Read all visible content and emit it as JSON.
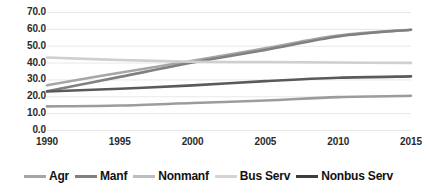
{
  "chart_data": {
    "type": "line",
    "title": "",
    "subtitle": "",
    "xlabel": "",
    "ylabel": "",
    "x": [
      1990,
      1995,
      2000,
      2005,
      2010,
      2015
    ],
    "categories": [
      "1990",
      "1995",
      "2000",
      "2005",
      "2010",
      "2015"
    ],
    "xtick_labels": [
      "1990",
      "1995",
      "2000",
      "2005",
      "2010",
      "2015"
    ],
    "ytick_labels": [
      "70.0",
      "60.0",
      "50.0",
      "40.0",
      "30.0",
      "20.0",
      "10.0",
      "0.0"
    ],
    "ytick_values": [
      70.0,
      60.0,
      50.0,
      40.0,
      30.0,
      20.0,
      10.0,
      0.0
    ],
    "ylim": [
      0.0,
      70.0
    ],
    "xlim": [
      1990,
      2015
    ],
    "grid": true,
    "grid_axis": "y",
    "legend_position": "bottom",
    "series": [
      {
        "name": "Agr",
        "color": "#a6a6a6",
        "values": [
          26.5,
          34.0,
          41.0,
          48.5,
          56.0,
          59.5
        ]
      },
      {
        "name": "Manf",
        "color": "#808080",
        "values": [
          23.0,
          31.5,
          40.0,
          47.5,
          55.5,
          59.5
        ]
      },
      {
        "name": "Nonmanf",
        "color": "#9c9c9c",
        "values": [
          14.0,
          14.5,
          16.0,
          17.5,
          19.5,
          20.3
        ]
      },
      {
        "name": "Bus Serv",
        "color": "#cfcfcf",
        "values": [
          43.0,
          41.5,
          40.5,
          40.3,
          40.0,
          39.8
        ]
      },
      {
        "name": "Nonbus Serv",
        "color": "#5a5a5a",
        "values": [
          22.8,
          24.5,
          26.5,
          29.0,
          31.0,
          31.8
        ]
      }
    ],
    "extra_series_note": "",
    "legend": [
      {
        "label": "Agr",
        "color": "#a6a6a6"
      },
      {
        "label": "Manf",
        "color": "#808080"
      },
      {
        "label": "Nonmanf",
        "color": "#bdbdbd"
      },
      {
        "label": "Bus Serv",
        "color": "#d4d4d4"
      },
      {
        "label": "Nonbus Serv",
        "color": "#3d3d3d"
      }
    ],
    "colors": {
      "grid": "#e8e8e8",
      "axis_text": "#2b2b2b",
      "legend_text": "#111111",
      "background": "#ffffff"
    }
  }
}
